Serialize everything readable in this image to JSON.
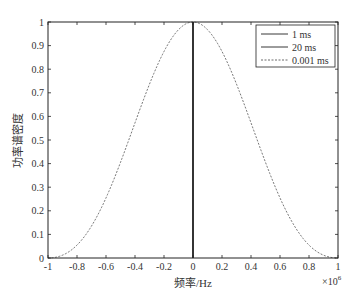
{
  "chart_data": {
    "type": "line",
    "title": "",
    "xlabel": "频率/Hz",
    "ylabel": "功率谱密度",
    "x_multiplier": "×10",
    "x_multiplier_exp": "6",
    "xlim": [
      -1,
      1
    ],
    "ylim": [
      0,
      1
    ],
    "grid": false,
    "legend_position": "upper right",
    "x_ticks": [
      -1,
      -0.8,
      -0.6,
      -0.4,
      -0.2,
      0,
      0.2,
      0.4,
      0.6,
      0.8,
      1
    ],
    "x_tick_labels": [
      "-1",
      "-0.8",
      "-0.6",
      "-0.4",
      "-0.2",
      "0",
      "0.2",
      "0.4",
      "0.6",
      "0.8",
      "1"
    ],
    "y_ticks": [
      0,
      0.1,
      0.2,
      0.3,
      0.4,
      0.5,
      0.6,
      0.7,
      0.8,
      0.9,
      1
    ],
    "y_tick_labels": [
      "0",
      "0.1",
      "0.2",
      "0.3",
      "0.4",
      "0.5",
      "0.6",
      "0.7",
      "0.8",
      "0.9",
      "1"
    ],
    "series": [
      {
        "name": "1 ms",
        "style": "solid",
        "x": [
          0,
          0
        ],
        "y": [
          0,
          1
        ]
      },
      {
        "name": "20 ms",
        "style": "solid",
        "x": [
          0,
          0
        ],
        "y": [
          0,
          1
        ]
      },
      {
        "name": "0.001 ms",
        "style": "dashed",
        "x": [
          -1,
          -0.9,
          -0.8,
          -0.7,
          -0.6,
          -0.5,
          -0.4,
          -0.3,
          -0.2,
          -0.1,
          0,
          0.1,
          0.2,
          0.3,
          0.4,
          0.5,
          0.6,
          0.7,
          0.8,
          0.9,
          1
        ],
        "y": [
          0,
          0.012,
          0.055,
          0.123,
          0.255,
          0.405,
          0.573,
          0.737,
          0.875,
          0.968,
          1,
          0.968,
          0.875,
          0.737,
          0.573,
          0.405,
          0.255,
          0.123,
          0.055,
          0.012,
          0
        ]
      }
    ]
  }
}
